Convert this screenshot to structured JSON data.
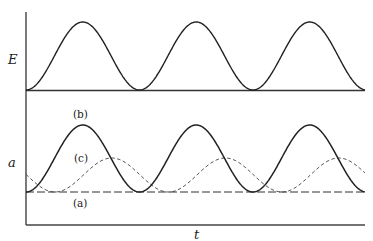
{
  "chart_data": {
    "type": "line",
    "title": "",
    "panels": [
      {
        "name": "top",
        "ylabel": "E",
        "xlabel": "",
        "series": [
          {
            "name": "E",
            "style": "solid",
            "description": "periodic raised-cosine pulses, 3 peaks",
            "peaks": 3,
            "relative_amplitude": 1.0,
            "phase": 0.0
          }
        ]
      },
      {
        "name": "bottom",
        "ylabel": "a",
        "xlabel": "t",
        "series": [
          {
            "name": "(a)",
            "label": "(a)",
            "style": "long-dash",
            "description": "constant zero line",
            "relative_amplitude": 0.0,
            "phase": 0.0
          },
          {
            "name": "(b)",
            "label": "(b)",
            "style": "solid",
            "description": "in phase with E, same shape",
            "relative_amplitude": 1.0,
            "phase": 0.0
          },
          {
            "name": "(c)",
            "label": "(c)",
            "style": "short-dash",
            "description": "lagging E by ~quarter period, about half amplitude",
            "relative_amplitude": 0.5,
            "phase": 0.255
          }
        ]
      }
    ],
    "x_range_periods": [
      0,
      2.98
    ],
    "grid": false,
    "legend": "inline labels"
  },
  "labels": {
    "E_axis": "E",
    "a_axis": "a",
    "t_axis": "t",
    "curve_a": "(a)",
    "curve_b": "(b)",
    "curve_c": "(c)"
  },
  "geometry": {
    "x0": 26,
    "x1": 365,
    "period": 113.5,
    "top": {
      "axis_top": 12,
      "baseline": 90,
      "amplitude": 68
    },
    "bottom": {
      "baseline": 192,
      "axis_bottom": 225,
      "amp_b": 67,
      "amp_c": 34,
      "phase_c_x": 55
    }
  }
}
